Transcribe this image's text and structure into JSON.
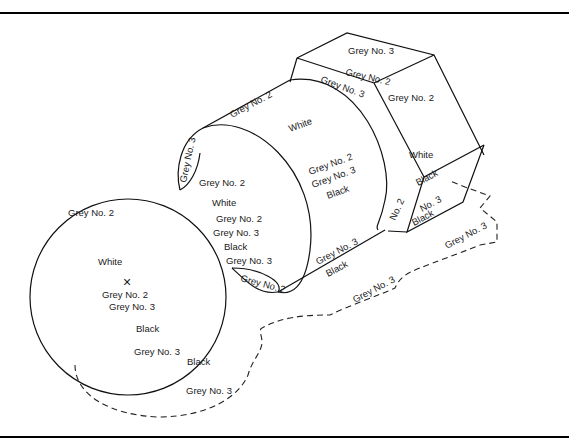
{
  "figure": {
    "colors": {
      "line": "#111111",
      "background": "#ffffff"
    }
  },
  "labels": {
    "hex_top": "Grey No. 3",
    "hex_top_mid": "Grey No. 2",
    "hex_top_front": "Grey No. 3",
    "hex_right_face": "Grey No. 2",
    "hex_right_white": "White",
    "hex_black_1": "Black",
    "hex_no2": "No. 2",
    "hex_no3": "No. 3",
    "hex_black_2": "Black",
    "cyl_top_edge": "Grey No. 2",
    "cyl_face_white": "White",
    "cyl_face_grey2": "Grey No. 2",
    "cyl_face_grey3": "Grey No. 3",
    "cyl_face_black": "Black",
    "cyl_bottom_grey3": "Grey No. 3",
    "cyl_bottom_black": "Black",
    "cyl_rim_grey3": "Grey No. 3",
    "cyl_left_grey2": "Grey No. 2",
    "cyl_left_white": "White",
    "cyl_left_grey2b": "Grey No. 2",
    "cyl_left_grey3": "Grey No. 3",
    "cyl_left_black": "Black",
    "cyl_left_grey3b": "Grey No. 3",
    "cyl_lens_grey2": "Grey No. 2",
    "disk_grey2": "Grey No. 2",
    "disk_white": "White",
    "disk_grey2b": "Grey No. 2",
    "disk_grey3": "Grey No. 3",
    "disk_black": "Black",
    "disk_grey3b": "Grey No. 3",
    "disk_black_edge": "Black",
    "shadow_disk": "Grey No. 3",
    "shadow_mid": "Grey No. 3",
    "shadow_right": "Grey No. 3",
    "center_mark": "×"
  }
}
